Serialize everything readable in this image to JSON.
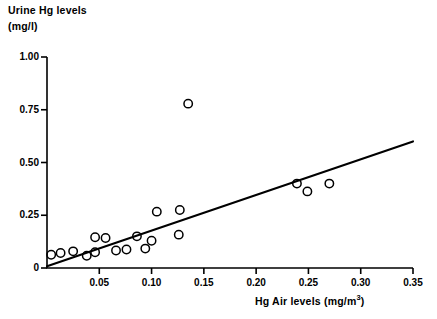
{
  "chart_data": {
    "type": "scatter",
    "title": "",
    "ylabel_line1": "Urine Hg levels",
    "ylabel_line2": "(mg/l)",
    "xlabel_text": "Hg Air levels (mg/m",
    "xlabel_sup": "3",
    "xlabel_close": ")",
    "xlabel": "Hg Air levels (mg/m3)",
    "ylabel": "Urine Hg levels (mg/l)",
    "grid": false,
    "legend": "none",
    "xlim": [
      0,
      0.35
    ],
    "ylim": [
      0,
      1.0
    ],
    "xticks": [
      0,
      0.05,
      0.1,
      0.15,
      0.2,
      0.25,
      0.3,
      0.35
    ],
    "xtick_labels": [
      "",
      "0.05",
      "0.10",
      "0.15",
      "0.20",
      "0.25",
      "0.30",
      "0.35"
    ],
    "yticks": [
      0,
      0.25,
      0.5,
      0.75,
      1.0
    ],
    "ytick_labels": [
      "0",
      "0.25",
      "0.50",
      "0.75",
      "1.00"
    ],
    "marker": "open-circle",
    "marker_color": "#000000",
    "line_color": "#000000",
    "points": [
      {
        "x": 0.004,
        "y": 0.063
      },
      {
        "x": 0.013,
        "y": 0.071
      },
      {
        "x": 0.025,
        "y": 0.079
      },
      {
        "x": 0.038,
        "y": 0.058
      },
      {
        "x": 0.046,
        "y": 0.075
      },
      {
        "x": 0.046,
        "y": 0.146
      },
      {
        "x": 0.056,
        "y": 0.142
      },
      {
        "x": 0.066,
        "y": 0.083
      },
      {
        "x": 0.076,
        "y": 0.088
      },
      {
        "x": 0.086,
        "y": 0.15
      },
      {
        "x": 0.094,
        "y": 0.092
      },
      {
        "x": 0.1,
        "y": 0.129
      },
      {
        "x": 0.105,
        "y": 0.267
      },
      {
        "x": 0.126,
        "y": 0.158
      },
      {
        "x": 0.127,
        "y": 0.275
      },
      {
        "x": 0.135,
        "y": 0.779
      },
      {
        "x": 0.239,
        "y": 0.4
      },
      {
        "x": 0.249,
        "y": 0.363
      },
      {
        "x": 0.27,
        "y": 0.4
      }
    ],
    "regression_line": {
      "label": "regression-line",
      "x0": 0.0,
      "y0": 0.008,
      "x1": 0.35,
      "y1": 0.6
    }
  }
}
